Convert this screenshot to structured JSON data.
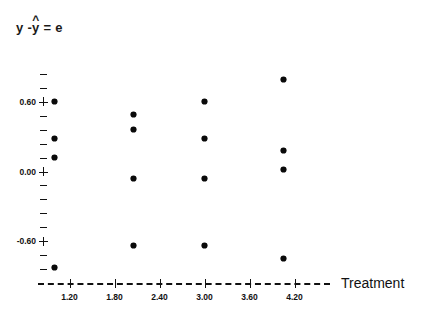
{
  "chart_data": {
    "type": "scatter",
    "title_parts": {
      "lhs": "y -",
      "hat": "^",
      "hatvar": "y",
      "rhs": "= e"
    },
    "xlabel": "Treatment",
    "ylabel": "",
    "xlim": [
      0.9,
      4.5
    ],
    "ylim": [
      -0.96,
      0.96
    ],
    "xticks": [
      1.2,
      1.8,
      2.4,
      3.0,
      3.6,
      4.2
    ],
    "xticklabels": [
      "1.20",
      "1.80",
      "2.40",
      "3.00",
      "3.60",
      "4.20"
    ],
    "yticks": [
      -0.84,
      -0.72,
      -0.6,
      -0.48,
      -0.36,
      -0.24,
      -0.12,
      0.0,
      0.12,
      0.24,
      0.36,
      0.48,
      0.6,
      0.72,
      0.84
    ],
    "ymajorticks": [
      -0.6,
      0.0,
      0.6
    ],
    "yticklabels": [
      "-0.60",
      "0.00",
      "0.60"
    ],
    "grid": false,
    "legend": null,
    "marker": "asterisk",
    "marker_color": "#0a0a0a",
    "axis_color": "#111111",
    "background": "#ffffff",
    "series": [
      {
        "name": "residuals",
        "points": [
          {
            "x": 1.0,
            "y": 0.6
          },
          {
            "x": 1.0,
            "y": 0.28
          },
          {
            "x": 1.0,
            "y": 0.12
          },
          {
            "x": 1.0,
            "y": -0.83
          },
          {
            "x": 2.05,
            "y": 0.49
          },
          {
            "x": 2.05,
            "y": 0.36
          },
          {
            "x": 2.05,
            "y": -0.06
          },
          {
            "x": 2.05,
            "y": -0.64
          },
          {
            "x": 3.0,
            "y": 0.6
          },
          {
            "x": 3.0,
            "y": 0.28
          },
          {
            "x": 3.0,
            "y": -0.06
          },
          {
            "x": 3.0,
            "y": -0.64
          },
          {
            "x": 4.05,
            "y": 0.79
          },
          {
            "x": 4.05,
            "y": 0.18
          },
          {
            "x": 4.05,
            "y": 0.02
          },
          {
            "x": 4.05,
            "y": -0.75
          }
        ]
      }
    ]
  }
}
